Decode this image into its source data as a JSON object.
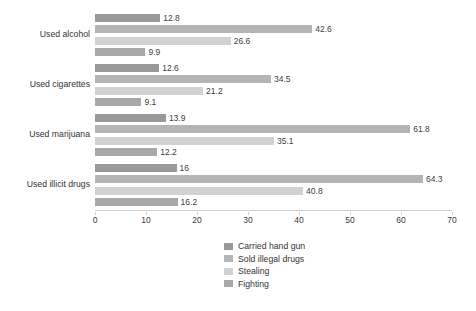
{
  "chart_data": {
    "type": "bar",
    "orientation": "horizontal",
    "title": "",
    "xlabel": "",
    "ylabel": "",
    "xlim": [
      0,
      70
    ],
    "xticks": [
      0,
      10,
      20,
      30,
      40,
      50,
      60,
      70
    ],
    "xtick_labels": [
      "0",
      "10",
      "20",
      "30",
      "40",
      "50",
      "60",
      "70"
    ],
    "grid": false,
    "legend_position": "bottom-center",
    "categories": [
      "Used alcohol",
      "Used cigarettes",
      "Used marijuana",
      "Used illicit drugs"
    ],
    "series": [
      {
        "name": "Carried hand gun",
        "color": "#999999",
        "values": [
          12.8,
          12.6,
          13.9,
          16
        ],
        "labels": [
          "12.8",
          "12.6",
          "13.9",
          "16"
        ]
      },
      {
        "name": "Sold illegal drugs",
        "color": "#b5b5b5",
        "values": [
          42.6,
          34.5,
          61.8,
          64.3
        ],
        "labels": [
          "42.6",
          "34.5",
          "61.8",
          "64.3"
        ]
      },
      {
        "name": "Stealing",
        "color": "#d2d2d2",
        "values": [
          26.6,
          21.2,
          35.1,
          40.8
        ],
        "labels": [
          "26.6",
          "21.2",
          "35.1",
          "40.8"
        ]
      },
      {
        "name": "Fighting",
        "color": "#a8a8a8",
        "values": [
          9.9,
          9.1,
          12.2,
          16.2
        ],
        "labels": [
          "9.9",
          "9.1",
          "12.2",
          "16.2"
        ]
      }
    ]
  },
  "legend": {
    "items": [
      {
        "label": "Carried hand gun",
        "color": "#999999"
      },
      {
        "label": "Sold illegal drugs",
        "color": "#b5b5b5"
      },
      {
        "label": "Stealing",
        "color": "#d2d2d2"
      },
      {
        "label": "Fighting",
        "color": "#a8a8a8"
      }
    ]
  },
  "colors": {
    "background": "#ffffff",
    "axis": "#cfcfcf",
    "text": "#333333"
  }
}
